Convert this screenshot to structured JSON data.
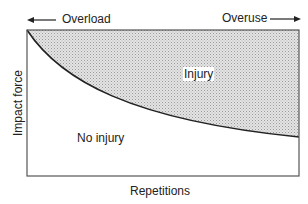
{
  "diagram": {
    "top_left_label": "Overload",
    "top_right_label": "Overuse",
    "y_axis_label": "Impact force",
    "x_axis_label": "Repetitions",
    "region_above_curve": "Injury",
    "region_below_curve": "No injury",
    "shade_color": "#c8c8c8",
    "line_color": "#222222"
  }
}
